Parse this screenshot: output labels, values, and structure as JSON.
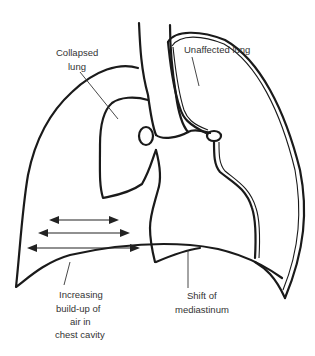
{
  "diagram": {
    "type": "anatomical illustration",
    "labels": {
      "collapsed_lung_line1": "Collapsed",
      "collapsed_lung_line2": "lung",
      "unaffected_lung": "Unaffected lung",
      "air_line1": "Increasing",
      "air_line2": "build-up of",
      "air_line3": "air in",
      "air_line4": "chest cavity",
      "mediastinum_line1": "Shift of",
      "mediastinum_line2": "mediastinum"
    },
    "arrows": {
      "count": 3,
      "direction": "bidirectional horizontal"
    },
    "colors": {
      "line": "#1a1a1a",
      "text": "#333333",
      "background": "#ffffff"
    }
  }
}
